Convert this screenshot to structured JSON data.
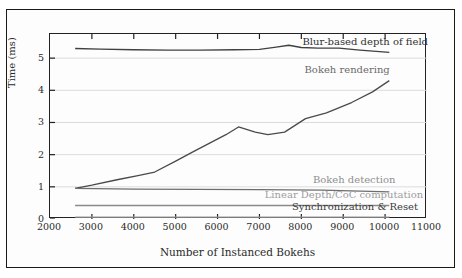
{
  "chart_data": {
    "type": "line",
    "title": "",
    "xlabel": "Number of Instanced Bokehs",
    "ylabel": "Time (ms)",
    "xlim": [
      2000,
      11000
    ],
    "ylim": [
      0,
      5.75
    ],
    "xticks": [
      2000,
      3000,
      4000,
      5000,
      6000,
      7000,
      8000,
      9000,
      10000,
      11000
    ],
    "yticks": [
      0,
      1,
      2,
      3,
      4,
      5
    ],
    "grid": true,
    "legend_position": "inline-annotations",
    "series": [
      {
        "name": "Blur-based depth of field",
        "color": "#404040",
        "x": [
          2600,
          3200,
          4000,
          4800,
          5600,
          6400,
          7000,
          7400,
          7700,
          8000,
          8400,
          8900,
          9400,
          10100
        ],
        "y": [
          5.3,
          5.28,
          5.26,
          5.25,
          5.25,
          5.26,
          5.27,
          5.34,
          5.4,
          5.33,
          5.31,
          5.31,
          5.25,
          5.18
        ]
      },
      {
        "name": "Bokeh rendering",
        "color": "#4a4a4a",
        "x": [
          2600,
          3000,
          3600,
          4100,
          4500,
          5000,
          5400,
          5800,
          6200,
          6500,
          6900,
          7200,
          7600,
          8100,
          8600,
          9200,
          9700,
          10100
        ],
        "y": [
          0.95,
          1.05,
          1.22,
          1.35,
          1.46,
          1.8,
          2.08,
          2.35,
          2.62,
          2.86,
          2.7,
          2.62,
          2.7,
          3.12,
          3.3,
          3.62,
          3.95,
          4.3
        ]
      },
      {
        "name": "Bokeh detection",
        "color": "#6e6e6e",
        "x": [
          2600,
          4000,
          5500,
          7000,
          8500,
          10100
        ],
        "y": [
          0.95,
          0.93,
          0.92,
          0.91,
          0.9,
          0.84
        ]
      },
      {
        "name": "Linear Depth/CoC computation",
        "color": "#8a8a8a",
        "x": [
          2600,
          5000,
          7500,
          10100
        ],
        "y": [
          0.42,
          0.42,
          0.42,
          0.42
        ]
      },
      {
        "name": "Synchronization & Reset",
        "color": "#9a9a9a",
        "x": [
          2600,
          5000,
          7500,
          10100
        ],
        "y": [
          0.06,
          0.06,
          0.06,
          0.06
        ]
      }
    ],
    "annotations": [
      {
        "text": "Blur-based depth of field",
        "x": 8050,
        "y": 5.3,
        "color": "#303030"
      },
      {
        "text": "Bokeh rendering",
        "x": 8100,
        "y": 4.45,
        "color": "#6a6a6a"
      },
      {
        "text": "Bokeh detection",
        "x": 8300,
        "y": 1.02,
        "color": "#8f8f8f"
      },
      {
        "text": "Linear Depth/CoC computation",
        "x": 7150,
        "y": 0.57,
        "color": "#9e9e9e"
      },
      {
        "text": "Synchronization & Reset",
        "x": 7800,
        "y": 0.18,
        "color": "#3a3a3a"
      }
    ]
  }
}
